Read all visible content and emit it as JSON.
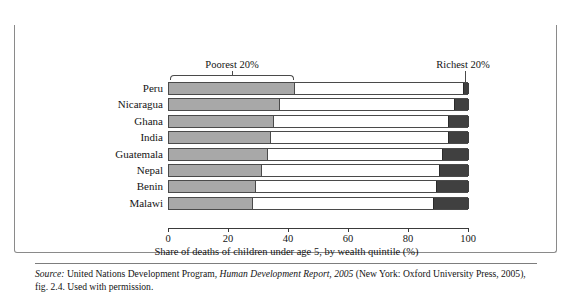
{
  "figure": {
    "number": "FIGURE 8.11",
    "title": "Children's Likelihood to Die in Selected Countries"
  },
  "annotations": {
    "poorest_label": "Poorest 20%",
    "richest_label": "Richest 20%"
  },
  "source": {
    "prefix": "Source:",
    "text_before_italic": " United Nations Development Program, ",
    "italic_title": "Human Development Report, 2005",
    "text_after_italic": " (New York: Oxford University Press, 2005), fig. 2.4. Used with permission."
  },
  "colors": {
    "header_bar": "#585858",
    "poorest_segment": "#a8a8a8",
    "richest_segment": "#404040",
    "middle_segment": "#ffffff",
    "outline": "#4a4a4a"
  },
  "chart_data": {
    "type": "bar",
    "orientation": "horizontal",
    "stacked": true,
    "title": "Children's Likelihood to Die in Selected Countries",
    "xlabel": "Share of deaths of children under age 5, by wealth quintile (%)",
    "ylabel": "",
    "xlim": [
      0,
      100
    ],
    "xticks": [
      0,
      20,
      40,
      60,
      80,
      100
    ],
    "xtick_labels": [
      "0",
      "20",
      "40",
      "60",
      "80",
      "100"
    ],
    "grid": false,
    "legend": [
      "Poorest 20%",
      "Richest 20%"
    ],
    "legend_position": "above-plot-callouts",
    "categories": [
      "Peru",
      "Nicaragua",
      "Ghana",
      "India",
      "Guatemala",
      "Nepal",
      "Benin",
      "Malawi"
    ],
    "series": [
      {
        "name": "Poorest 20%",
        "values": [
          42,
          37,
          35,
          34,
          33,
          31,
          29,
          28
        ]
      },
      {
        "name": "Middle 60%",
        "values": [
          56,
          58,
          58,
          59,
          58,
          59,
          60,
          60
        ]
      },
      {
        "name": "Richest 20%",
        "values": [
          2,
          5,
          7,
          7,
          9,
          10,
          11,
          12
        ]
      }
    ],
    "bars": [
      {
        "country": "Peru",
        "poorest": 42,
        "richest_start": 98,
        "richest": 2
      },
      {
        "country": "Nicaragua",
        "poorest": 37,
        "richest_start": 95,
        "richest": 5
      },
      {
        "country": "Ghana",
        "poorest": 35,
        "richest_start": 93,
        "richest": 7
      },
      {
        "country": "India",
        "poorest": 34,
        "richest_start": 93,
        "richest": 7
      },
      {
        "country": "Guatemala",
        "poorest": 33,
        "richest_start": 91,
        "richest": 9
      },
      {
        "country": "Nepal",
        "poorest": 31,
        "richest_start": 90,
        "richest": 10
      },
      {
        "country": "Benin",
        "poorest": 29,
        "richest_start": 89,
        "richest": 11
      },
      {
        "country": "Malawi",
        "poorest": 28,
        "richest_start": 88,
        "richest": 12
      }
    ]
  }
}
